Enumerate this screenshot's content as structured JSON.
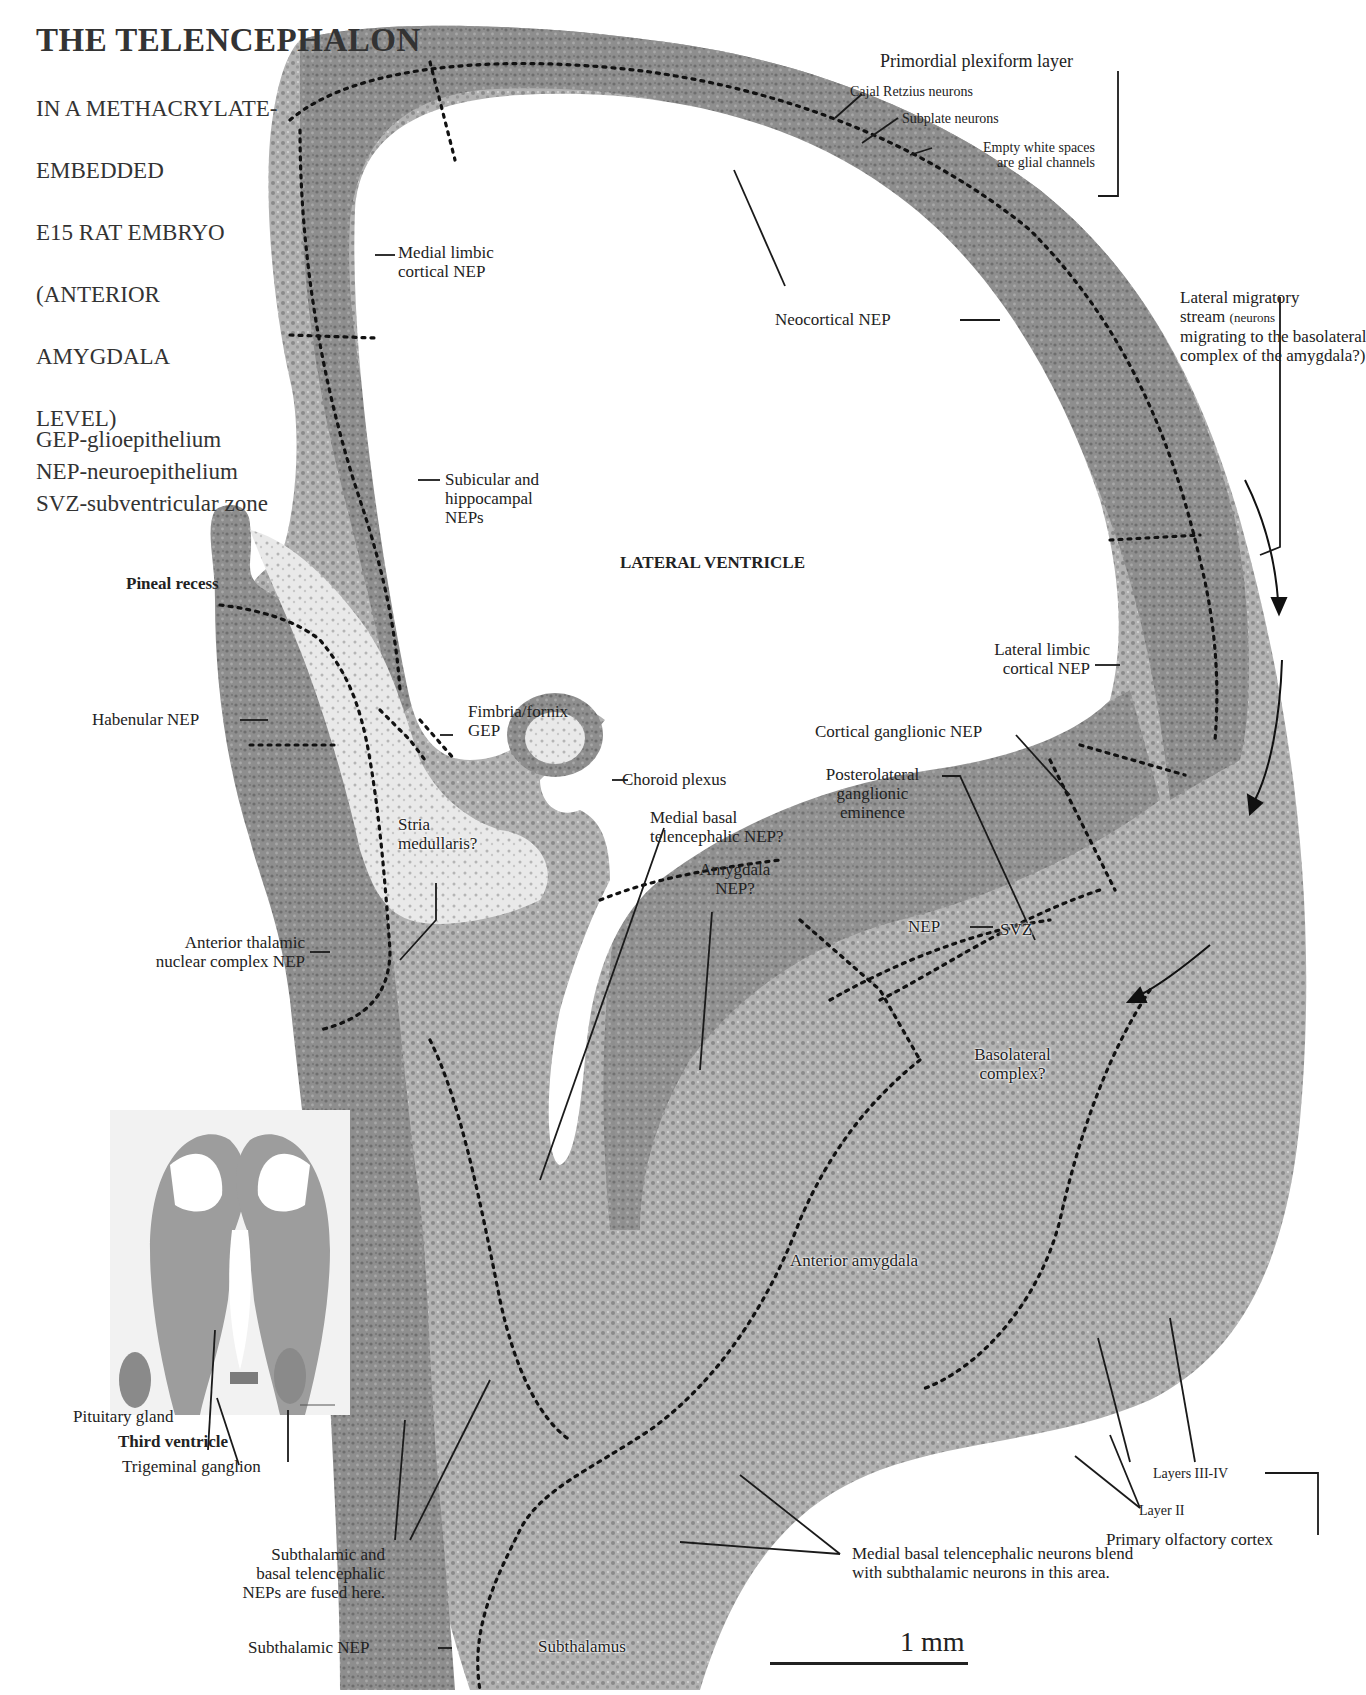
{
  "page": {
    "number_fragment": "6"
  },
  "header": {
    "title": "THE TELENCEPHALON",
    "subtitle_lines": [
      "IN A METHACRYLATE-",
      "EMBEDDED",
      "E15 RAT EMBRYO",
      "(ANTERIOR",
      "AMYGDALA",
      "LEVEL)"
    ]
  },
  "legend": {
    "items": [
      "GEP-glioepithelium",
      "NEP-neuroepithelium",
      "SVZ-subventricular zone"
    ]
  },
  "colors": {
    "tissue_dark": "#7a7a7a",
    "tissue_mid": "#9a9a9a",
    "tissue_light": "#c4c4c4",
    "background": "#ffffff",
    "text": "#222222",
    "boundary_dots": "#111111"
  },
  "labels": {
    "primordial_plexiform_layer": "Primordial plexiform layer",
    "cajal_retzius": "Cajal Retzius neurons",
    "subplate": "Subplate neurons",
    "glial_channels_1": "Empty white spaces",
    "glial_channels_2": "are glial channels",
    "medial_limbic_1": "Medial limbic",
    "medial_limbic_2": "cortical NEP",
    "neocortical": "Neocortical NEP",
    "lateral_migratory_1": "Lateral migratory",
    "lateral_migratory_2": "stream",
    "lateral_migratory_2b": "(neurons",
    "lateral_migratory_3": "migrating to the basolateral",
    "lateral_migratory_4": "complex of the amygdala?)",
    "subicular_1": "Subicular and",
    "subicular_2": "hippocampal",
    "subicular_3": "NEPs",
    "lateral_ventricle": "LATERAL VENTRICLE",
    "pineal_recess": "Pineal recess",
    "lateral_limbic_1": "Lateral limbic",
    "lateral_limbic_2": "cortical NEP",
    "habenular": "Habenular NEP",
    "fimbria_1": "Fimbria/fornix",
    "fimbria_2": "GEP",
    "cortical_ganglionic": "Cortical ganglionic NEP",
    "choroid_plexus": "Choroid plexus",
    "posterolateral_1": "Posterolateral",
    "posterolateral_2": "ganglionic",
    "posterolateral_3": "eminence",
    "stria_1": "Stria",
    "stria_2": "medullaris?",
    "medial_basal_1": "Medial basal",
    "medial_basal_2": "telencephalic NEP?",
    "amygdala_nep_1": "Amygdala",
    "amygdala_nep_2": "NEP?",
    "nep": "NEP",
    "svz": "SVZ",
    "anterior_thalamic_1": "Anterior thalamic",
    "anterior_thalamic_2": "nuclear complex NEP",
    "basolateral_1": "Basolateral",
    "basolateral_2": "complex?",
    "anterior_amygdala": "Anterior amygdala",
    "pituitary": "Pituitary gland",
    "third_ventricle": "Third ventricle",
    "trigeminal": "Trigeminal ganglion",
    "layers_3_4": "Layers III-IV",
    "layer_2": "Layer II",
    "primary_olfactory": "Primary olfactory cortex",
    "fused_1": "Subthalamic and",
    "fused_2": "basal telencephalic",
    "fused_3": "NEPs are fused here.",
    "blend_1": "Medial basal telencephalic neurons blend",
    "blend_2": "with subthalamic neurons in this area.",
    "subthalamic_nep": "Subthalamic NEP",
    "subthalamus": "Subthalamus"
  },
  "scale_bar": {
    "label": "1 mm"
  }
}
